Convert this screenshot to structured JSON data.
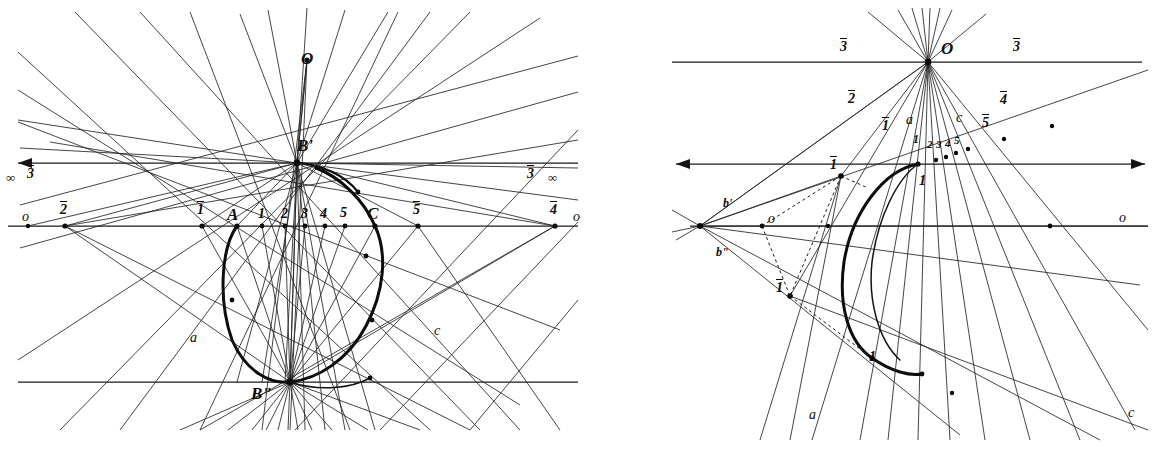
{
  "figure": {
    "kind": "projective-geometry-construction",
    "width": 1156,
    "height": 451,
    "ink_color": "#0d0d0d",
    "paper_color": "#ffffff"
  },
  "left_panel": {
    "name": "left-construction",
    "vertices": {
      "O": {
        "label": "O",
        "x": 307,
        "y": 60
      },
      "Bp": {
        "label": "B'",
        "x": 297,
        "y": 163
      },
      "Bpp": {
        "label": "B\"",
        "x": 290,
        "y": 382
      }
    },
    "upper_line": {
      "label_left_infinity": "∞",
      "label_left_ray": "3",
      "label_right_ray": "3",
      "label_right_infinity": "∞",
      "y": 163,
      "x_start": 18,
      "x_end": 578,
      "arrow_left": true,
      "arrow_right": false
    },
    "base_line": {
      "y": 226,
      "x_start": 10,
      "x_end": 578,
      "label_left_o": "o",
      "label_right_o": "o",
      "points": [
        {
          "label": "2",
          "bar": true,
          "x": 65,
          "style": "bar"
        },
        {
          "label": "1",
          "bar": true,
          "x": 202,
          "style": "bar"
        },
        {
          "label": "A",
          "bar": false,
          "x": 237,
          "style": "cap"
        },
        {
          "label": "1",
          "bar": false,
          "x": 262,
          "style": "num"
        },
        {
          "label": "2",
          "bar": false,
          "x": 285,
          "style": "num"
        },
        {
          "label": "3",
          "bar": false,
          "x": 305,
          "style": "num"
        },
        {
          "label": "4",
          "bar": false,
          "x": 325,
          "style": "num"
        },
        {
          "label": "5",
          "bar": false,
          "x": 345,
          "style": "num"
        },
        {
          "label": "C",
          "bar": false,
          "x": 375,
          "style": "cap"
        },
        {
          "label": "5",
          "bar": true,
          "x": 418,
          "style": "bar"
        },
        {
          "label": "4",
          "bar": true,
          "x": 555,
          "style": "bar"
        }
      ]
    },
    "lower_line": {
      "y": 382,
      "x_start": 18,
      "x_end": 578
    },
    "ray_labels": [
      {
        "label": "a",
        "x": 193,
        "y": 338
      },
      {
        "label": "c",
        "x": 437,
        "y": 331
      }
    ]
  },
  "right_panel": {
    "name": "right-construction",
    "vertices": {
      "O": {
        "label": "O",
        "x": 928,
        "y": 62
      },
      "V1": {
        "label": "1",
        "bar": true,
        "x": 841,
        "y": 176
      },
      "V2": {
        "label": "1",
        "bar": true,
        "x": 790,
        "y": 296
      },
      "Bp": {
        "label": "b'",
        "x": 772,
        "y": 206
      },
      "Bpp": {
        "label": "b\"",
        "x": 713,
        "y": 253
      }
    },
    "top_line": {
      "y": 62,
      "x_start": 672,
      "x_end": 1142,
      "label_left": "3",
      "label_right": "3"
    },
    "mid_line": {
      "y": 164,
      "x_start": 676,
      "x_end": 1145,
      "arrow_left": true,
      "arrow_right": true
    },
    "o_line": {
      "y": 226,
      "x_start": 688,
      "x_end": 1148,
      "label_left": "o",
      "label_right": "o"
    },
    "ray_labels": [
      {
        "label": "2",
        "bar": true,
        "x": 851,
        "y": 98
      },
      {
        "label": "1",
        "bar": true,
        "x": 885,
        "y": 125
      },
      {
        "label": "a",
        "x": 908,
        "y": 117
      },
      {
        "label": "c",
        "x": 958,
        "y": 115
      },
      {
        "label": "5",
        "bar": true,
        "x": 985,
        "y": 122
      },
      {
        "label": "4",
        "bar": true,
        "x": 1003,
        "y": 99
      },
      {
        "label": "1",
        "x": 916,
        "y": 139
      },
      {
        "label": "2",
        "x": 929,
        "y": 144
      },
      {
        "label": "3",
        "x": 938,
        "y": 145
      },
      {
        "label": "4",
        "x": 947,
        "y": 144
      },
      {
        "label": "5",
        "x": 956,
        "y": 141
      },
      {
        "label": "1",
        "x": 922,
        "y": 181
      },
      {
        "label": "1",
        "x": 872,
        "y": 358
      },
      {
        "label": "a",
        "x": 812,
        "y": 415
      },
      {
        "label": "c",
        "x": 1131,
        "y": 413
      }
    ]
  }
}
